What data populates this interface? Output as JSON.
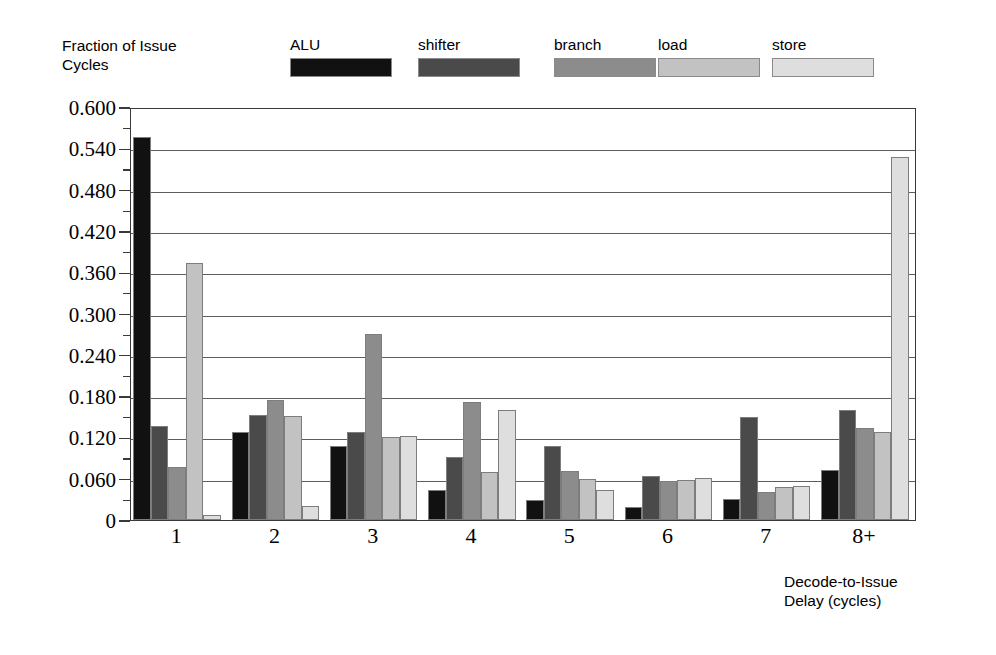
{
  "chart_data": {
    "type": "bar",
    "title": "",
    "ylabel": "Fraction of Issue\nCycles",
    "xlabel": "Decode-to-Issue\nDelay (cycles)",
    "categories": [
      "1",
      "2",
      "3",
      "4",
      "5",
      "6",
      "7",
      "8+"
    ],
    "ylim": [
      0,
      0.6
    ],
    "ytick_labels": [
      "0",
      "0.060",
      "0.120",
      "0.180",
      "0.240",
      "0.300",
      "0.360",
      "0.420",
      "0.480",
      "0.540",
      "0.600"
    ],
    "ytick_values": [
      0,
      0.06,
      0.12,
      0.18,
      0.24,
      0.3,
      0.36,
      0.42,
      0.48,
      0.54,
      0.6
    ],
    "minor_tick_interval": 0.03,
    "grid": true,
    "legend_position": "top",
    "series": [
      {
        "name": "ALU",
        "color": "#111111",
        "values": [
          0.557,
          0.128,
          0.108,
          0.043,
          0.029,
          0.019,
          0.03,
          0.073
        ]
      },
      {
        "name": "shifter",
        "color": "#4a4a4a",
        "values": [
          0.137,
          0.152,
          0.128,
          0.091,
          0.108,
          0.064,
          0.15,
          0.16
        ]
      },
      {
        "name": "branch",
        "color": "#8c8c8c",
        "values": [
          0.077,
          0.174,
          0.27,
          0.172,
          0.071,
          0.056,
          0.041,
          0.133
        ]
      },
      {
        "name": "load",
        "color": "#c2c2c2",
        "values": [
          0.373,
          0.151,
          0.121,
          0.07,
          0.06,
          0.058,
          0.048,
          0.128
        ]
      },
      {
        "name": "store",
        "color": "#dedede",
        "values": [
          0.008,
          0.02,
          0.122,
          0.16,
          0.043,
          0.061,
          0.05,
          0.528
        ]
      }
    ]
  }
}
